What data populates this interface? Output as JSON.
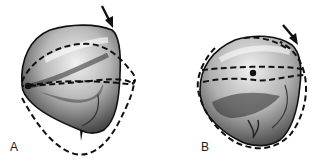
{
  "figure": {
    "panels": [
      {
        "id": "A",
        "label": "A",
        "subject": "tooth-crown-occlusal-view",
        "annotations": [
          "arrow-pointing-to-cusp",
          "dashed-outline-overlays",
          "contact-point-dot"
        ]
      },
      {
        "id": "B",
        "label": "B",
        "subject": "tooth-crown-occlusal-view",
        "annotations": [
          "arrow-pointing-to-cusp",
          "dashed-outline-overlays",
          "contact-point-dot"
        ]
      }
    ],
    "colors": {
      "ink": "#111111",
      "background": "#ffffff",
      "shade_dark": "#3a3a3a",
      "shade_light": "#e6e6e6"
    }
  }
}
